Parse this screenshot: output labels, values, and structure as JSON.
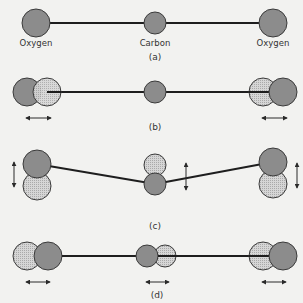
{
  "colors": {
    "background": "#f2f2f0",
    "atom_dark": "#8c8c8c",
    "atom_light": "#cfcfcf",
    "bond": "#1e1e1e",
    "outline": "#3a3a3a",
    "arrow": "#2a2a2a"
  },
  "atom_labels": {
    "left": "Oxygen",
    "center": "Carbon",
    "right": "Oxygen"
  },
  "panels": [
    {
      "label": "(a)",
      "mode": "equilibrium"
    },
    {
      "label": "(b)",
      "mode": "symmetric-stretch"
    },
    {
      "label": "(c)",
      "mode": "bending"
    },
    {
      "label": "(d)",
      "mode": "asymmetric-stretch"
    }
  ],
  "legend": {
    "dark_atom": "equilibrium position",
    "dotted_atom": "displaced position"
  }
}
